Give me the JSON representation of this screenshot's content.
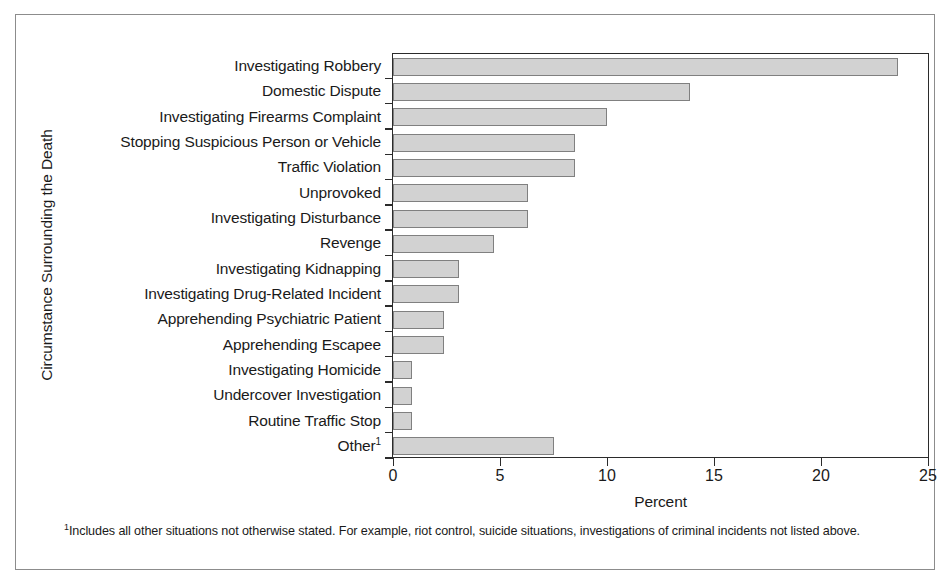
{
  "chart_data": {
    "type": "bar",
    "orientation": "horizontal",
    "title": "",
    "xlabel": "Percent",
    "ylabel": "Circumstance Surrounding the Death",
    "xlim": [
      0,
      25
    ],
    "xticks": [
      0,
      5,
      10,
      15,
      20,
      25
    ],
    "xtick_labels": [
      "0",
      "5",
      "10",
      "15",
      "20",
      "25"
    ],
    "grid": false,
    "legend": false,
    "bar_color": "#d2d2d2",
    "bar_edge_color": "#808080",
    "axis_color": "#2b2b2b",
    "categories": [
      "Investigating Robbery",
      "Domestic Dispute",
      "Investigating Firearms Complaint",
      "Stopping Suspicious Person or Vehicle",
      "Traffic Violation",
      "Unprovoked",
      "Investigating Disturbance",
      "Revenge",
      "Investigating Kidnapping",
      "Investigating Drug-Related Incident",
      "Apprehending Psychiatric Patient",
      "Apprehending Escapee",
      "Investigating Homicide",
      "Undercover Investigation",
      "Routine Traffic Stop",
      "Other"
    ],
    "category_footnote_markers": [
      "",
      "",
      "",
      "",
      "",
      "",
      "",
      "",
      "",
      "",
      "",
      "",
      "",
      "",
      "",
      "1"
    ],
    "values": [
      23.6,
      13.9,
      10.0,
      8.5,
      8.5,
      6.3,
      6.3,
      4.7,
      3.1,
      3.1,
      2.4,
      2.4,
      0.9,
      0.9,
      0.9,
      7.5
    ],
    "footnotes": [
      {
        "marker": "1",
        "text": "Includes all other situations not otherwise stated. For example, riot control, suicide situations, investigations of criminal incidents not listed above."
      }
    ]
  }
}
